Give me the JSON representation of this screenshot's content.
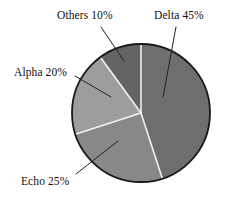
{
  "chart_data": {
    "type": "pie",
    "title": "",
    "subtitle": "",
    "xlabel": "",
    "ylabel": "",
    "legend_position": "none",
    "grid": false,
    "labels_show_percent": true,
    "start_angle_deg": 90,
    "direction": "clockwise",
    "categories": [
      "Delta",
      "Echo",
      "Alpha",
      "Others"
    ],
    "values": [
      45,
      25,
      20,
      10
    ],
    "units": "%",
    "slices": [
      {
        "name": "Delta",
        "value": 45,
        "label": "Delta 45%",
        "color": "#6e6e6e",
        "start_deg": 0,
        "end_deg": 162
      },
      {
        "name": "Echo",
        "value": 25,
        "label": "Echo 25%",
        "color": "#888888",
        "start_deg": 162,
        "end_deg": 252
      },
      {
        "name": "Alpha",
        "value": 20,
        "label": "Alpha 20%",
        "color": "#9d9d9d",
        "start_deg": 252,
        "end_deg": 324
      },
      {
        "name": "Others",
        "value": 10,
        "label": "Others 10%",
        "color": "#646464",
        "start_deg": 324,
        "end_deg": 360
      }
    ],
    "annotations": [
      {
        "name": "Delta",
        "text": "Delta 45%"
      },
      {
        "name": "Echo",
        "text": "Echo 25%"
      },
      {
        "name": "Alpha",
        "text": "Alpha 20%"
      },
      {
        "name": "Others",
        "text": "Others 10%"
      }
    ],
    "style": {
      "outline_color": "#1a1a1a",
      "separator_color": "#f2f2f2",
      "leader_line_color": "#222222",
      "background": "#ffffff"
    }
  }
}
